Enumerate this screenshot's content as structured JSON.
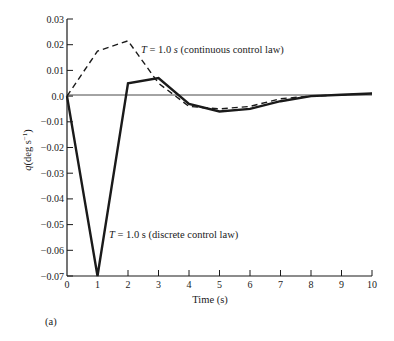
{
  "chart_data": {
    "type": "line",
    "title": "",
    "xlabel": "Time (s)",
    "ylabel": "q(deg s^-1)",
    "ylabel_parts": {
      "q": "q",
      "unit": "(deg s",
      "sup": "−1",
      "close": ")"
    },
    "xlim": [
      0,
      10
    ],
    "ylim": [
      -0.07,
      0.03
    ],
    "x_ticks": [
      "0",
      "1",
      "2",
      "3",
      "4",
      "5",
      "6",
      "7",
      "8",
      "9",
      "10"
    ],
    "y_ticks": [
      "0.03",
      "0.02",
      "0.01",
      "0.0",
      "−0.01",
      "−0.02",
      "−0.03",
      "−0.04",
      "−0.05",
      "−0.06",
      "−0.07"
    ],
    "y_tick_values": [
      0.03,
      0.02,
      0.01,
      0.0,
      -0.01,
      -0.02,
      -0.03,
      -0.04,
      -0.05,
      -0.06,
      -0.07
    ],
    "grid": false,
    "x": [
      0,
      1,
      2,
      3,
      4,
      5,
      6,
      7,
      8,
      9,
      10
    ],
    "series": [
      {
        "name": "T = 1.0 s (continuous control law)",
        "style": "dashed",
        "values": [
          0.0,
          0.0175,
          0.0215,
          0.005,
          -0.004,
          -0.005,
          -0.004,
          -0.001,
          0.0,
          0.0005,
          0.001
        ]
      },
      {
        "name": "T = 1.0 s (discrete control law)",
        "style": "solid",
        "values": [
          0.0,
          -0.07,
          0.005,
          0.007,
          -0.003,
          -0.006,
          -0.005,
          -0.002,
          0.0,
          0.0005,
          0.001
        ]
      }
    ],
    "annotations": [
      {
        "T": "T",
        "rest": " = 1.0 ",
        "s": "s",
        "tail": " (continuous control law)"
      },
      {
        "T": "T",
        "rest": " = 1.0 s (discrete control law)"
      }
    ],
    "panel_label": "(a)"
  }
}
